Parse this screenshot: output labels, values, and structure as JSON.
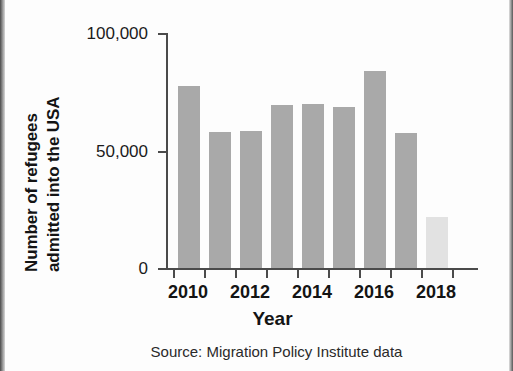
{
  "chart_data": {
    "type": "bar",
    "title": "",
    "xlabel": "Year",
    "ylabel": "Number of refugees admitted into the USA",
    "ylabel_lines": [
      "Number of refugees",
      "admitted into the USA"
    ],
    "categories": [
      "2010",
      "2011",
      "2012",
      "2013",
      "2014",
      "2015",
      "2016",
      "2017",
      "2018"
    ],
    "values": [
      77500,
      58000,
      58500,
      69500,
      70000,
      68500,
      84000,
      57500,
      21500
    ],
    "bars": [
      {
        "year": "2010",
        "value": 77500,
        "color": "#a9a9a9",
        "highlight": false
      },
      {
        "year": "2011",
        "value": 58000,
        "color": "#a9a9a9",
        "highlight": false
      },
      {
        "year": "2012",
        "value": 58500,
        "color": "#a9a9a9",
        "highlight": false
      },
      {
        "year": "2013",
        "value": 69500,
        "color": "#a9a9a9",
        "highlight": false
      },
      {
        "year": "2014",
        "value": 70000,
        "color": "#a9a9a9",
        "highlight": false
      },
      {
        "year": "2015",
        "value": 68500,
        "color": "#a9a9a9",
        "highlight": false
      },
      {
        "year": "2016",
        "value": 84000,
        "color": "#a9a9a9",
        "highlight": false
      },
      {
        "year": "2017",
        "value": 57500,
        "color": "#a9a9a9",
        "highlight": false
      },
      {
        "year": "2018",
        "value": 21500,
        "color": "#e2e2e2",
        "highlight": true
      }
    ],
    "ylim": [
      0,
      100000
    ],
    "yticks": [
      0,
      50000,
      100000
    ],
    "ytick_labels": [
      "0",
      "50,000",
      "100,000"
    ],
    "xtick_labels": [
      "2010",
      "2012",
      "2014",
      "2016",
      "2018"
    ],
    "xtick_labeled_years": [
      "2010",
      "2012",
      "2014",
      "2016",
      "2018"
    ],
    "grid": false,
    "legend": null,
    "source": "Source: Migration Policy Institute data",
    "colors": {
      "bar": "#a9a9a9",
      "bar_highlight": "#e2e2e2",
      "axis": "#4b4b4b",
      "text": "#141414",
      "background": "#fdfdfd"
    }
  }
}
